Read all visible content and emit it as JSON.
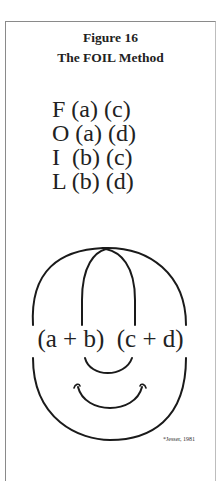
{
  "figure": {
    "number_label": "Figure 16",
    "title": "The FOIL Method"
  },
  "foil_rows": [
    {
      "letter": "F",
      "text": "F (a) (c)"
    },
    {
      "letter": "O",
      "text": "O (a) (d)"
    },
    {
      "letter": "I",
      "text": "I  (b) (c)"
    },
    {
      "letter": "L",
      "text": "L (b) (d)"
    }
  ],
  "face": {
    "left_factor": "(a + b)",
    "right_factor": "(c + d)",
    "expression": "(a + b)  (c + d)"
  },
  "citation": "*Jesser, 1981",
  "colors": {
    "ink": "#1a1a1a",
    "frame": "#8a8a8a",
    "background": "#ffffff"
  }
}
